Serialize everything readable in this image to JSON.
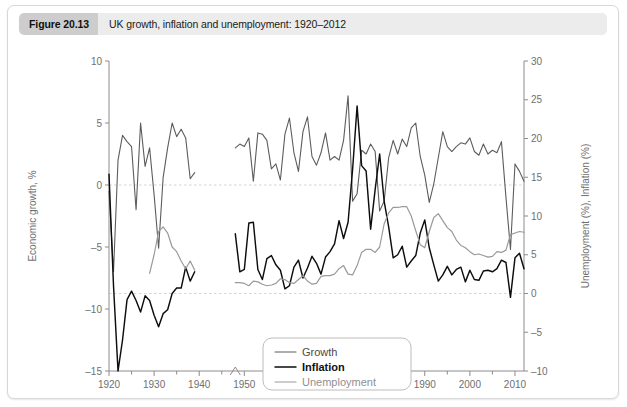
{
  "figure": {
    "number_label": "Figure 20.13",
    "caption": "UK growth, inflation and unemployment: 1920–2012"
  },
  "chart_data": {
    "type": "line",
    "title": "UK growth, inflation and unemployment: 1920–2012",
    "xlabel": "",
    "ylabel": "Economic growth, %",
    "y2label": "Unemployment (%), Inflation (%)",
    "xlim": [
      1920,
      2012
    ],
    "ylim": [
      -15,
      10
    ],
    "y2lim": [
      -10,
      30
    ],
    "xticks": [
      1920,
      1930,
      1940,
      1950,
      1960,
      1970,
      1980,
      1990,
      2000,
      2010
    ],
    "xtick_labels": [
      "1920",
      "1930",
      "1940",
      "1950",
      "1960",
      "1970",
      "1980",
      "1990",
      "2000",
      "2010"
    ],
    "xminor_step": 5,
    "yticks": [
      -15,
      -10,
      -5,
      0,
      5,
      10
    ],
    "ytick_labels": [
      "–15",
      "–10",
      "–5",
      "0",
      "5",
      "10"
    ],
    "y2ticks": [
      -10,
      -5,
      0,
      5,
      10,
      15,
      20,
      25,
      30
    ],
    "y2tick_labels": [
      "–10",
      "–5",
      "0",
      "5",
      "10",
      "15",
      "20",
      "25",
      "30"
    ],
    "grid": true,
    "gridlines_left_axis": [
      0
    ],
    "gridlines_right_axis": [
      0
    ],
    "legend_position": "bottom-center",
    "axis_break_year": 1948,
    "data_gap_years": [
      1939,
      1948
    ],
    "series": [
      {
        "name": "Growth",
        "axis": "left",
        "units": "%",
        "color": "#5c5c5c",
        "x": [
          1920,
          1921,
          1922,
          1923,
          1924,
          1925,
          1926,
          1927,
          1928,
          1929,
          1930,
          1931,
          1932,
          1933,
          1934,
          1935,
          1936,
          1937,
          1938,
          1939,
          1948,
          1949,
          1950,
          1951,
          1952,
          1953,
          1954,
          1955,
          1956,
          1957,
          1958,
          1959,
          1960,
          1961,
          1962,
          1963,
          1964,
          1965,
          1966,
          1967,
          1968,
          1969,
          1970,
          1971,
          1972,
          1973,
          1974,
          1975,
          1976,
          1977,
          1978,
          1979,
          1980,
          1981,
          1982,
          1983,
          1984,
          1985,
          1986,
          1987,
          1988,
          1989,
          1990,
          1991,
          1992,
          1993,
          1994,
          1995,
          1996,
          1997,
          1998,
          1999,
          2000,
          2001,
          2002,
          2003,
          2004,
          2005,
          2006,
          2007,
          2008,
          2009,
          2010,
          2011,
          2012
        ],
        "values": [
          -0.5,
          -7.0,
          2.0,
          4.0,
          3.5,
          3.1,
          -2.0,
          5.0,
          1.5,
          3.0,
          -0.8,
          -5.1,
          0.6,
          3.0,
          5.0,
          3.9,
          4.5,
          3.8,
          0.5,
          1.0,
          3.0,
          3.3,
          3.1,
          3.8,
          0.3,
          4.2,
          4.1,
          3.6,
          1.3,
          1.7,
          0.4,
          4.1,
          5.4,
          2.6,
          1.1,
          4.3,
          5.5,
          2.3,
          1.6,
          2.6,
          4.2,
          2.0,
          2.3,
          2.0,
          3.6,
          7.2,
          -1.3,
          -0.7,
          2.8,
          2.5,
          3.3,
          2.7,
          -2.1,
          -1.3,
          2.2,
          3.6,
          2.5,
          3.7,
          3.1,
          4.6,
          5.0,
          2.3,
          0.8,
          -1.4,
          0.1,
          2.2,
          4.3,
          3.1,
          2.7,
          3.1,
          3.4,
          3.3,
          3.8,
          2.7,
          2.4,
          3.3,
          2.5,
          2.8,
          2.6,
          3.5,
          -1.0,
          -5.2,
          1.7,
          1.1,
          0.3
        ]
      },
      {
        "name": "Inflation",
        "axis": "right",
        "units": "%",
        "color": "#0d0d0d",
        "x": [
          1920,
          1921,
          1922,
          1923,
          1924,
          1925,
          1926,
          1927,
          1928,
          1929,
          1930,
          1931,
          1932,
          1933,
          1934,
          1935,
          1936,
          1937,
          1938,
          1939,
          1948,
          1949,
          1950,
          1951,
          1952,
          1953,
          1954,
          1955,
          1956,
          1957,
          1958,
          1959,
          1960,
          1961,
          1962,
          1963,
          1964,
          1965,
          1966,
          1967,
          1968,
          1969,
          1970,
          1971,
          1972,
          1973,
          1974,
          1975,
          1976,
          1977,
          1978,
          1979,
          1980,
          1981,
          1982,
          1983,
          1984,
          1985,
          1986,
          1987,
          1988,
          1989,
          1990,
          1991,
          1992,
          1993,
          1994,
          1995,
          1996,
          1997,
          1998,
          1999,
          2000,
          2001,
          2002,
          2003,
          2004,
          2005,
          2006,
          2007,
          2008,
          2009,
          2010,
          2011,
          2012
        ],
        "values": [
          15.4,
          1.0,
          -10.0,
          -6.0,
          -0.8,
          0.3,
          -0.9,
          -2.4,
          -0.3,
          -0.9,
          -2.8,
          -4.3,
          -2.6,
          -2.1,
          0.0,
          0.7,
          0.7,
          3.4,
          1.6,
          2.8,
          7.7,
          2.8,
          3.1,
          9.1,
          9.2,
          3.1,
          1.8,
          4.5,
          4.9,
          3.7,
          3.0,
          0.6,
          1.0,
          3.4,
          4.3,
          2.0,
          3.3,
          4.8,
          3.9,
          2.5,
          4.7,
          5.4,
          6.4,
          9.4,
          7.1,
          9.2,
          16.0,
          24.2,
          16.5,
          15.8,
          8.3,
          13.4,
          18.0,
          11.9,
          8.6,
          4.6,
          5.0,
          6.1,
          3.4,
          4.2,
          4.9,
          7.8,
          9.5,
          5.9,
          3.7,
          1.6,
          2.4,
          3.5,
          2.4,
          3.1,
          3.4,
          1.5,
          3.0,
          1.8,
          1.7,
          2.9,
          3.0,
          2.8,
          3.2,
          4.3,
          4.0,
          -0.5,
          4.6,
          5.2,
          3.2
        ]
      },
      {
        "name": "Unemployment",
        "axis": "right",
        "units": "%",
        "color": "#9a9a9a",
        "x": [
          1929,
          1930,
          1931,
          1932,
          1933,
          1934,
          1935,
          1936,
          1937,
          1938,
          1939,
          1948,
          1949,
          1950,
          1951,
          1952,
          1953,
          1954,
          1955,
          1956,
          1957,
          1958,
          1959,
          1960,
          1961,
          1962,
          1963,
          1964,
          1965,
          1966,
          1967,
          1968,
          1969,
          1970,
          1971,
          1972,
          1973,
          1974,
          1975,
          1976,
          1977,
          1978,
          1979,
          1980,
          1981,
          1982,
          1983,
          1984,
          1985,
          1986,
          1987,
          1988,
          1989,
          1990,
          1991,
          1992,
          1993,
          1994,
          1995,
          1996,
          1997,
          1998,
          1999,
          2000,
          2001,
          2002,
          2003,
          2004,
          2005,
          2006,
          2007,
          2008,
          2009,
          2010,
          2011,
          2012
        ],
        "values": [
          2.6,
          5.0,
          8.0,
          8.6,
          7.8,
          6.0,
          5.4,
          4.2,
          3.2,
          4.2,
          3.0,
          1.4,
          1.4,
          1.3,
          1.0,
          1.6,
          1.5,
          1.2,
          1.0,
          1.1,
          1.3,
          1.9,
          1.8,
          1.4,
          1.3,
          1.8,
          2.3,
          1.6,
          1.2,
          1.3,
          2.2,
          2.3,
          2.3,
          2.5,
          3.2,
          3.6,
          2.5,
          2.4,
          3.6,
          5.3,
          5.7,
          5.7,
          5.3,
          6.0,
          9.0,
          10.4,
          11.1,
          11.1,
          11.2,
          11.2,
          10.0,
          8.1,
          6.3,
          5.9,
          8.0,
          9.8,
          10.3,
          9.4,
          8.5,
          8.0,
          6.9,
          6.2,
          5.9,
          5.4,
          5.0,
          5.1,
          4.9,
          4.7,
          4.8,
          5.4,
          5.3,
          5.6,
          7.6,
          7.8,
          8.0,
          7.9
        ]
      }
    ]
  },
  "legend": {
    "items": [
      {
        "label": "Growth"
      },
      {
        "label": "Inflation"
      },
      {
        "label": "Unemployment"
      }
    ]
  }
}
